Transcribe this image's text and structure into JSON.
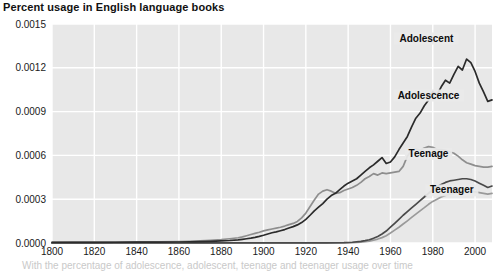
{
  "chart_data": {
    "type": "line",
    "title": "Percent usage in English language books",
    "xlabel": "",
    "ylabel": "",
    "xlim": [
      1800,
      2008
    ],
    "ylim": [
      0.0,
      0.0015
    ],
    "grid": true,
    "legend_position": "inline-labels",
    "plot_background": "#e8e8e8",
    "xticks": [
      1800,
      1820,
      1840,
      1860,
      1880,
      1900,
      1920,
      1940,
      1960,
      1980,
      2000
    ],
    "xtick_labels": [
      "1800",
      "1820",
      "1840",
      "1860",
      "1880",
      "1900",
      "1920",
      "1940",
      "1960",
      "1980",
      "2000"
    ],
    "yticks": [
      0.0,
      0.0003,
      0.0006,
      0.0009,
      0.0012,
      0.0015
    ],
    "ytick_labels": [
      "0.0000",
      "0.0003",
      "0.0006",
      "0.0009",
      "0.0012",
      "0.0015"
    ],
    "series": [
      {
        "name": "Adolescent",
        "color": "#2b2b2b",
        "label_x": 1977,
        "label_y": 0.00138,
        "x": [
          1800,
          1810,
          1820,
          1830,
          1840,
          1850,
          1860,
          1865,
          1870,
          1875,
          1880,
          1884,
          1888,
          1890,
          1892,
          1894,
          1896,
          1898,
          1900,
          1902,
          1904,
          1906,
          1908,
          1910,
          1912,
          1914,
          1916,
          1918,
          1920,
          1922,
          1924,
          1926,
          1928,
          1930,
          1932,
          1934,
          1936,
          1938,
          1940,
          1942,
          1944,
          1946,
          1948,
          1950,
          1952,
          1954,
          1956,
          1958,
          1960,
          1962,
          1964,
          1966,
          1968,
          1970,
          1972,
          1974,
          1976,
          1978,
          1980,
          1982,
          1984,
          1986,
          1988,
          1990,
          1992,
          1994,
          1996,
          1998,
          2000,
          2002,
          2004,
          2006,
          2008
        ],
        "y": [
          4e-06,
          4.2e-06,
          4.5e-06,
          5e-06,
          5.5e-06,
          6e-06,
          7e-06,
          8e-06,
          9.5e-06,
          1.15e-05,
          1.4e-05,
          1.7e-05,
          2.15e-05,
          2.5e-05,
          2.9e-05,
          3.3e-05,
          3.8e-05,
          4.5e-05,
          5.3e-05,
          6.2e-05,
          7e-05,
          7.6e-05,
          8.4e-05,
          9.2e-05,
          0.000103,
          0.000112,
          0.000124,
          0.00014,
          0.000162,
          0.00019,
          0.00022,
          0.000245,
          0.00027,
          0.0003,
          0.000325,
          0.00034,
          0.000365,
          0.00039,
          0.00041,
          0.000425,
          0.00044,
          0.000465,
          0.00049,
          0.000515,
          0.000535,
          0.00056,
          0.000585,
          0.000545,
          0.000555,
          0.00059,
          0.00064,
          0.000685,
          0.00073,
          0.000795,
          0.000855,
          0.00089,
          0.00094,
          0.00098,
          0.001035,
          0.001015,
          0.00107,
          0.001115,
          0.001095,
          0.001155,
          0.00121,
          0.001185,
          0.00126,
          0.001235,
          0.001175,
          0.001095,
          0.001035,
          0.00097,
          0.00098
        ]
      },
      {
        "name": "Adolescence",
        "color": "#8e8e8e",
        "label_x": 1978,
        "label_y": 0.00099,
        "x": [
          1800,
          1810,
          1820,
          1830,
          1840,
          1850,
          1860,
          1865,
          1870,
          1875,
          1880,
          1884,
          1888,
          1890,
          1892,
          1894,
          1896,
          1898,
          1900,
          1902,
          1904,
          1906,
          1908,
          1910,
          1912,
          1914,
          1916,
          1918,
          1920,
          1922,
          1924,
          1926,
          1928,
          1930,
          1932,
          1934,
          1936,
          1938,
          1940,
          1942,
          1944,
          1946,
          1948,
          1950,
          1952,
          1954,
          1956,
          1958,
          1960,
          1962,
          1964,
          1966,
          1968,
          1970,
          1972,
          1974,
          1976,
          1978,
          1980,
          1982,
          1984,
          1986,
          1988,
          1990,
          1992,
          1994,
          1996,
          1998,
          2000,
          2002,
          2004,
          2006,
          2008
        ],
        "y": [
          5e-06,
          5.5e-06,
          6e-06,
          6.5e-06,
          7.5e-06,
          8.5e-06,
          1e-05,
          1.15e-05,
          1.4e-05,
          1.8e-05,
          2.3e-05,
          2.9e-05,
          3.6e-05,
          4.2e-05,
          5e-05,
          5.8e-05,
          6.6e-05,
          7.4e-05,
          8.3e-05,
          9e-05,
          9.6e-05,
          0.000102,
          0.000108,
          0.000116,
          0.000126,
          0.000134,
          0.000148,
          0.000172,
          0.000205,
          0.00025,
          0.000295,
          0.000335,
          0.000355,
          0.000365,
          0.000355,
          0.00034,
          0.000345,
          0.00036,
          0.00037,
          0.00038,
          0.000395,
          0.000415,
          0.00044,
          0.000455,
          0.000475,
          0.000465,
          0.00048,
          0.000475,
          0.00048,
          0.000485,
          0.00049,
          0.000525,
          0.000595,
          0.000635,
          0.000645,
          0.000635,
          0.00065,
          0.00066,
          0.000655,
          0.00064,
          0.00064,
          0.000635,
          0.000625,
          0.000615,
          0.000595,
          0.00057,
          0.00055,
          0.00054,
          0.00053,
          0.000525,
          0.00052,
          0.00052,
          0.000525
        ]
      },
      {
        "name": "Teenage",
        "color": "#4a4a4a",
        "label_x": 1978,
        "label_y": 0.00059,
        "x": [
          1800,
          1850,
          1900,
          1920,
          1930,
          1938,
          1942,
          1946,
          1948,
          1950,
          1952,
          1954,
          1956,
          1958,
          1960,
          1962,
          1964,
          1966,
          1968,
          1970,
          1972,
          1974,
          1976,
          1978,
          1980,
          1982,
          1984,
          1986,
          1988,
          1990,
          1992,
          1994,
          1996,
          1998,
          2000,
          2002,
          2004,
          2006,
          2008
        ],
        "y": [
          5e-07,
          6e-07,
          8e-07,
          1e-06,
          1.5e-06,
          2.5e-06,
          5e-06,
          1.1e-05,
          1.6e-05,
          2.2e-05,
          3.2e-05,
          4.5e-05,
          6.2e-05,
          8.2e-05,
          0.000108,
          0.000135,
          0.000162,
          0.00019,
          0.000215,
          0.00024,
          0.000265,
          0.00029,
          0.000315,
          0.00034,
          0.000365,
          0.000385,
          0.0004,
          0.000415,
          0.000425,
          0.00043,
          0.000435,
          0.00044,
          0.00044,
          0.000435,
          0.000425,
          0.00041,
          0.000395,
          0.00038,
          0.00039
        ]
      },
      {
        "name": "Teenager",
        "color": "#9a9a9a",
        "label_x": 1989,
        "label_y": 0.00034,
        "x": [
          1800,
          1850,
          1900,
          1920,
          1930,
          1938,
          1942,
          1946,
          1948,
          1950,
          1952,
          1954,
          1956,
          1958,
          1960,
          1962,
          1964,
          1966,
          1968,
          1970,
          1972,
          1974,
          1976,
          1978,
          1980,
          1982,
          1984,
          1986,
          1988,
          1990,
          1992,
          1994,
          1996,
          1998,
          2000,
          2002,
          2004,
          2006,
          2008
        ],
        "y": [
          3e-07,
          4e-07,
          5e-07,
          6e-07,
          8e-07,
          1.2e-06,
          2.5e-06,
          6e-06,
          9e-06,
          1.3e-05,
          1.9e-05,
          2.7e-05,
          3.7e-05,
          5e-05,
          6.8e-05,
          8.8e-05,
          0.000108,
          0.00013,
          0.000152,
          0.000175,
          0.000198,
          0.00022,
          0.000242,
          0.000265,
          0.000285,
          0.0003,
          0.000315,
          0.000325,
          0.000335,
          0.00034,
          0.000345,
          0.00035,
          0.000355,
          0.000355,
          0.00035,
          0.000345,
          0.00034,
          0.000335,
          0.00034
        ]
      }
    ]
  },
  "caption": {
    "text": "With the percentage of adolescence, adolescent, teenage and teenager usage over time"
  }
}
